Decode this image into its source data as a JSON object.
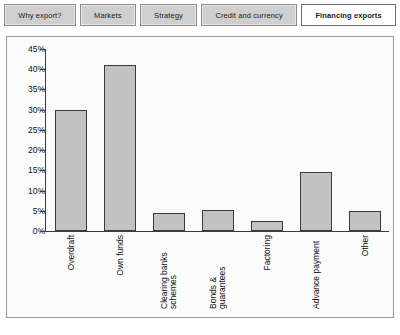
{
  "tabs": [
    {
      "label": "Why export?",
      "active": false
    },
    {
      "label": "Markets",
      "active": false
    },
    {
      "label": "Strategy",
      "active": false
    },
    {
      "label": "Credit and currency",
      "active": false
    },
    {
      "label": "Financing exports",
      "active": true
    }
  ],
  "colors": {
    "bar_fill": "#c2c2c2",
    "bar_border": "#3a3a3a",
    "axis": "#3d3d3d",
    "panel_background": "#fbfbfb",
    "panel_border": "#9a9a9a",
    "tab_background": "#cfcfcf",
    "tab_active_background": "#ffffff"
  },
  "chart_data": {
    "type": "bar",
    "title": "",
    "xlabel": "",
    "ylabel": "",
    "categories": [
      "Overdraft",
      "Clearing banks schemes",
      "Own funds",
      "Bonds & guarantees",
      "Factoring",
      "Advance payment",
      "Other"
    ],
    "ordered_categories": [
      "Overdraft",
      "Own funds",
      "Clearing banks schemes",
      "Bonds & guarantees",
      "Factoring",
      "Advance payment",
      "Other"
    ],
    "values": [
      30,
      41,
      4.5,
      5.2,
      2.5,
      14.5,
      5
    ],
    "ylim": [
      0,
      45
    ],
    "ytick_labels": [
      "45%",
      "40%",
      "35%",
      "30%",
      "25%",
      "20%",
      "15%",
      "10%",
      "5%",
      "0%"
    ],
    "ytick_values": [
      45,
      40,
      35,
      30,
      25,
      20,
      15,
      10,
      5,
      0
    ],
    "grid": false,
    "legend": false
  }
}
